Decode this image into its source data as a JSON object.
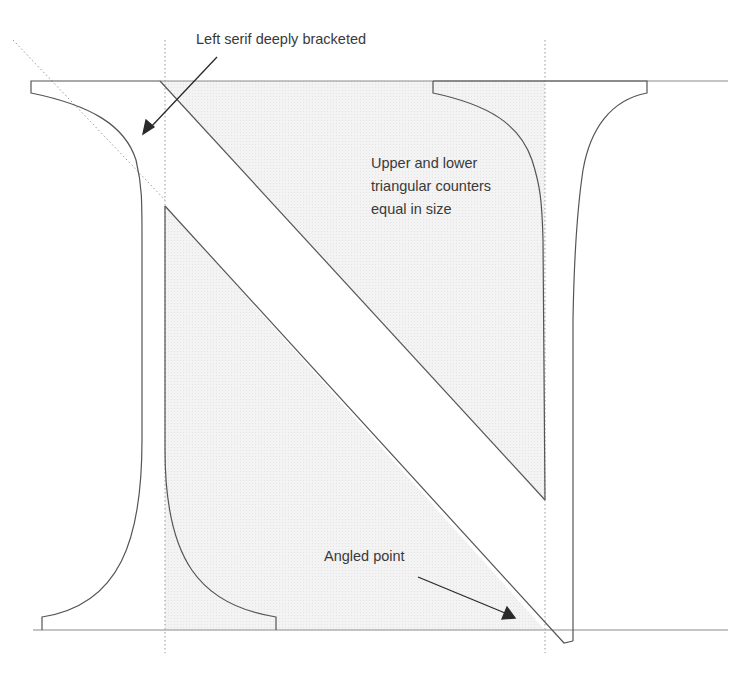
{
  "diagram": {
    "annotations": [
      {
        "id": "left-serif",
        "text": "Left serif deeply bracketed"
      },
      {
        "id": "counters",
        "lines": [
          "Upper and lower",
          "triangular counters",
          "equal in size"
        ]
      },
      {
        "id": "angled-point",
        "text": "Angled point"
      }
    ],
    "colors": {
      "outline": "#555555",
      "counter_fill": "#efefef",
      "guide": "#999999",
      "text": "#3a3a3a",
      "arrow": "#2a2a2a"
    },
    "guides": {
      "cap_line_y": 81,
      "baseline_y": 630,
      "left_vertical_x": 165,
      "right_vertical_x": 545
    }
  }
}
